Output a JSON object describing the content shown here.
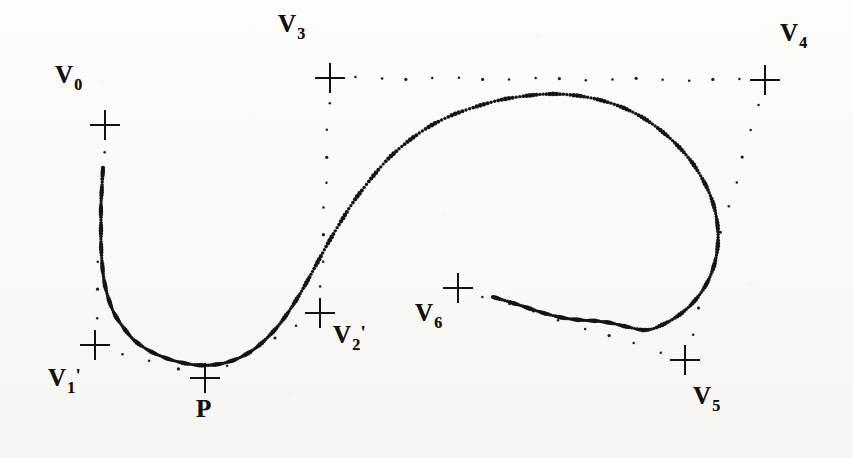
{
  "figure": {
    "kind": "spline-control-polygon-diagram",
    "background_color": "#fbfbf9",
    "ink_color": "#111111",
    "width": 853,
    "height": 458
  },
  "labels": [
    {
      "id": "v0",
      "base": "V",
      "subscript": "0",
      "prime": "",
      "text": "V0",
      "x": 55,
      "y": 62
    },
    {
      "id": "v1p",
      "base": "V",
      "subscript": "1",
      "prime": "'",
      "text": "V1'",
      "x": 48,
      "y": 365
    },
    {
      "id": "v2p",
      "base": "V",
      "subscript": "2",
      "prime": "'",
      "text": "V2'",
      "x": 333,
      "y": 322
    },
    {
      "id": "v3",
      "base": "V",
      "subscript": "3",
      "prime": "",
      "text": "V3",
      "x": 278,
      "y": 11
    },
    {
      "id": "v4",
      "base": "V",
      "subscript": "4",
      "prime": "",
      "text": "V4",
      "x": 780,
      "y": 20
    },
    {
      "id": "v5",
      "base": "V",
      "subscript": "5",
      "prime": "",
      "text": "V5",
      "x": 693,
      "y": 383
    },
    {
      "id": "v6",
      "base": "V",
      "subscript": "6",
      "prime": "",
      "text": "V6",
      "x": 415,
      "y": 300
    },
    {
      "id": "p",
      "base": "P",
      "subscript": "",
      "prime": "",
      "text": "P",
      "x": 196,
      "y": 396
    }
  ],
  "chart_data": {
    "type": "scatter",
    "title": "",
    "xlabel": "",
    "ylabel": "",
    "xlim": [
      0,
      853
    ],
    "ylim": [
      0,
      458
    ],
    "grid": false,
    "legend": null,
    "control_points": [
      {
        "name": "V0",
        "x": 105,
        "y": 125
      },
      {
        "name": "V1'",
        "x": 95,
        "y": 345
      },
      {
        "name": "P",
        "x": 205,
        "y": 378
      },
      {
        "name": "V2'",
        "x": 320,
        "y": 313
      },
      {
        "name": "V3",
        "x": 330,
        "y": 78
      },
      {
        "name": "V4",
        "x": 765,
        "y": 80
      },
      {
        "name": "V5",
        "x": 685,
        "y": 360
      },
      {
        "name": "V6",
        "x": 458,
        "y": 288
      }
    ],
    "control_polygon_segments": [
      {
        "from": "V0",
        "to": "V1'",
        "style": "dotted"
      },
      {
        "from": "V1'",
        "to": "P",
        "style": "dotted"
      },
      {
        "from": "P",
        "to": "V2'",
        "style": "dotted"
      },
      {
        "from": "V2'",
        "to": "V3",
        "style": "dotted"
      },
      {
        "from": "V3",
        "to": "V4",
        "style": "dotted"
      },
      {
        "from": "V4",
        "to": "V5",
        "style": "dotted"
      },
      {
        "from": "V5",
        "to": "V6",
        "style": "dotted"
      }
    ],
    "series": [
      {
        "name": "spline-curve-upper",
        "style": "dense-dotted",
        "points": [
          [
            103,
            168
          ],
          [
            102,
            186
          ],
          [
            101,
            205
          ],
          [
            101,
            224
          ],
          [
            101,
            243
          ],
          [
            102,
            262
          ],
          [
            104,
            280
          ],
          [
            108,
            297
          ],
          [
            114,
            313
          ],
          [
            123,
            327
          ],
          [
            134,
            340
          ],
          [
            148,
            350
          ],
          [
            163,
            357
          ],
          [
            179,
            362
          ],
          [
            196,
            365
          ],
          [
            212,
            365
          ],
          [
            228,
            362
          ],
          [
            243,
            356
          ],
          [
            257,
            347
          ],
          [
            270,
            335
          ],
          [
            282,
            321
          ],
          [
            293,
            305
          ],
          [
            304,
            287
          ],
          [
            315,
            267
          ],
          [
            327,
            245
          ],
          [
            340,
            223
          ],
          [
            354,
            201
          ],
          [
            370,
            180
          ],
          [
            387,
            160
          ],
          [
            406,
            143
          ],
          [
            427,
            128
          ],
          [
            450,
            116
          ],
          [
            475,
            107
          ],
          [
            500,
            100
          ],
          [
            525,
            96
          ],
          [
            548,
            94
          ],
          [
            572,
            95
          ],
          [
            596,
            99
          ],
          [
            619,
            106
          ],
          [
            640,
            116
          ],
          [
            659,
            129
          ],
          [
            676,
            144
          ],
          [
            691,
            161
          ],
          [
            703,
            180
          ],
          [
            712,
            200
          ],
          [
            717,
            221
          ],
          [
            718,
            242
          ],
          [
            715,
            262
          ],
          [
            708,
            281
          ],
          [
            697,
            298
          ],
          [
            683,
            312
          ],
          [
            666,
            323
          ],
          [
            647,
            330
          ],
          [
            628,
            327
          ],
          [
            611,
            323
          ],
          [
            596,
            321
          ],
          [
            580,
            320
          ],
          [
            564,
            318
          ],
          [
            547,
            314
          ],
          [
            531,
            309
          ],
          [
            516,
            304
          ],
          [
            503,
            300
          ],
          [
            493,
            297
          ]
        ]
      }
    ],
    "markers": {
      "shape": "plus-cross",
      "size_px": 30,
      "stroke_px": 2
    }
  }
}
